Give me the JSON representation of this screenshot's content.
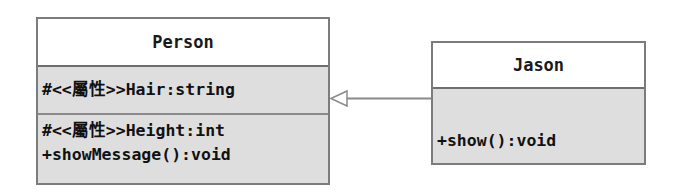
{
  "diagram": {
    "type": "uml-class-diagram",
    "classes": [
      {
        "name": "Person",
        "attributes": [
          "#<<屬性>>Hair:string"
        ],
        "methods": [
          "#<<屬性>>Height:int",
          "+showMessage():void"
        ]
      },
      {
        "name": "Jason",
        "attributes": [],
        "methods": [
          "+show():void"
        ]
      }
    ],
    "relationships": [
      {
        "type": "generalization",
        "from": "Jason",
        "to": "Person",
        "arrow": "hollow-triangle"
      }
    ]
  },
  "colors": {
    "header_fill": "#ffffff",
    "body_fill": "#dedede",
    "border": "#7c7c7c",
    "connector": "#8a8a8a"
  }
}
